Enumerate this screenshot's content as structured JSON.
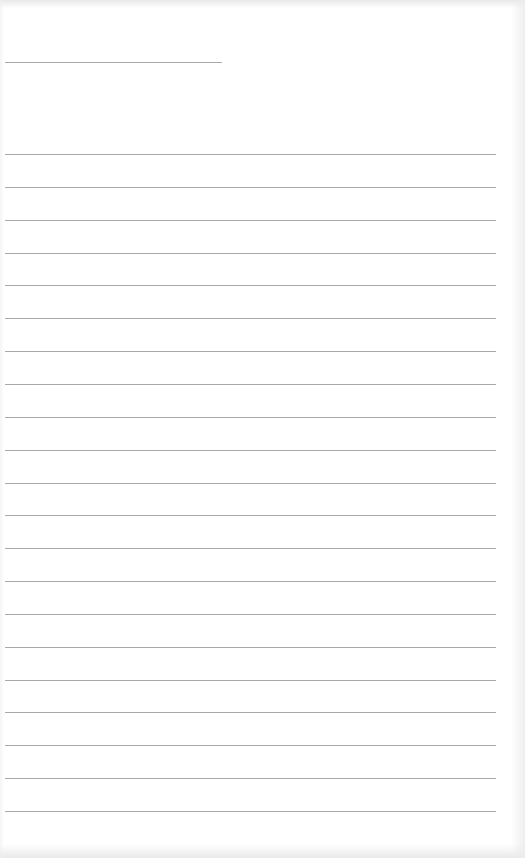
{
  "document": {
    "type": "blank lined paper",
    "header_line": {
      "x": 5,
      "y": 62,
      "width": 217,
      "text": ""
    },
    "ruled_lines": {
      "count": 21,
      "x": 5,
      "width": 491,
      "first_y": 154,
      "spacing": 32.85,
      "color": "#9a9a9a",
      "entries": [
        "",
        "",
        "",
        "",
        "",
        "",
        "",
        "",
        "",
        "",
        "",
        "",
        "",
        "",
        "",
        "",
        "",
        "",
        "",
        "",
        ""
      ]
    }
  }
}
